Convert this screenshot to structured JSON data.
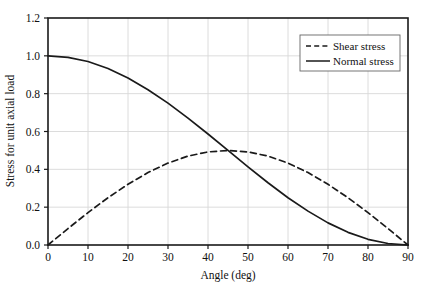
{
  "chart_data": {
    "type": "line",
    "title": "",
    "xlabel": "Angle (deg)",
    "ylabel": "Stress for unit axial load",
    "xlim": [
      0,
      90
    ],
    "ylim": [
      0.0,
      1.2
    ],
    "xticks": [
      "0",
      "10",
      "20",
      "30",
      "40",
      "50",
      "60",
      "70",
      "80",
      "90"
    ],
    "yticks": [
      "0.0",
      "0.2",
      "0.4",
      "0.6",
      "0.8",
      "1.0",
      "1.2"
    ],
    "grid": "both",
    "legend_position": "upper-right",
    "x": [
      0,
      5,
      10,
      15,
      20,
      25,
      30,
      35,
      40,
      45,
      50,
      55,
      60,
      65,
      70,
      75,
      80,
      85,
      90
    ],
    "series": [
      {
        "name": "Shear stress",
        "style": "dashed",
        "color": "#1a1a1a",
        "values": [
          0.0,
          0.087,
          0.171,
          0.25,
          0.321,
          0.383,
          0.433,
          0.47,
          0.492,
          0.5,
          0.492,
          0.47,
          0.433,
          0.383,
          0.321,
          0.25,
          0.171,
          0.087,
          0.0
        ]
      },
      {
        "name": "Normal stress",
        "style": "solid",
        "color": "#1a1a1a",
        "values": [
          1.0,
          0.992,
          0.97,
          0.933,
          0.883,
          0.821,
          0.75,
          0.671,
          0.587,
          0.5,
          0.413,
          0.329,
          0.25,
          0.179,
          0.117,
          0.067,
          0.03,
          0.008,
          0.0
        ]
      }
    ],
    "annotations": {
      "crossing_point": {
        "x": 45,
        "y": 0.5
      }
    },
    "colors": {
      "axis": "#1a1a1a",
      "grid": "#d8d8d8",
      "text": "#111111",
      "background": "#ffffff"
    }
  },
  "legend": {
    "items": [
      {
        "label": "Shear stress",
        "style": "dashed"
      },
      {
        "label": "Normal stress",
        "style": "solid"
      }
    ]
  }
}
